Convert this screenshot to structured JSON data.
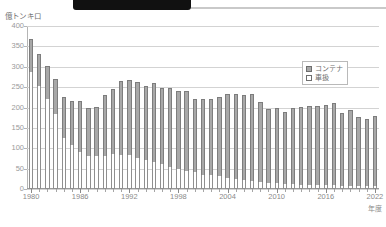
{
  "decorations": {
    "top_banner": "banner-fragment"
  },
  "axis": {
    "y_unit_label": "億トンキロ",
    "y_ticks": [
      400,
      350,
      300,
      250,
      200,
      150,
      100,
      50,
      0
    ],
    "x_title": "年度",
    "x_labels": [
      1980,
      1986,
      1992,
      1998,
      2004,
      2010,
      2016,
      2022
    ]
  },
  "legend": {
    "position": "top-right",
    "items": [
      {
        "label": "コンテナ",
        "swatch": "container",
        "color": "#a8a8a8"
      },
      {
        "label": "車扱",
        "swatch": "carload",
        "color": "#ffffff"
      }
    ]
  },
  "chart_data": {
    "type": "bar",
    "stacked": true,
    "title": "",
    "xlabel": "年度",
    "ylabel": "億トンキロ",
    "ylim": [
      0,
      400
    ],
    "ytick_step": 50,
    "grid": true,
    "legend_position": "top-right",
    "x": [
      1980,
      1981,
      1982,
      1983,
      1984,
      1985,
      1986,
      1987,
      1988,
      1989,
      1990,
      1991,
      1992,
      1993,
      1994,
      1995,
      1996,
      1997,
      1998,
      1999,
      2000,
      2001,
      2002,
      2003,
      2004,
      2005,
      2006,
      2007,
      2008,
      2009,
      2010,
      2011,
      2012,
      2013,
      2014,
      2015,
      2016,
      2017,
      2018,
      2019,
      2020,
      2021,
      2022
    ],
    "series": [
      {
        "name": "車扱",
        "color": "#ffffff",
        "values": [
          287,
          254,
          220,
          185,
          125,
          108,
          91,
          80,
          80,
          82,
          85,
          83,
          84,
          76,
          72,
          66,
          61,
          53,
          50,
          45,
          41,
          35,
          34,
          31,
          28,
          25,
          22,
          20,
          18,
          15,
          14,
          13,
          12,
          11,
          10,
          9,
          9,
          9,
          8,
          8,
          7,
          7,
          7
        ]
      },
      {
        "name": "コンテナ",
        "color": "#a8a8a8",
        "values": [
          81,
          78,
          81,
          85,
          100,
          107,
          124,
          120,
          121,
          148,
          160,
          182,
          183,
          186,
          180,
          194,
          188,
          195,
          190,
          195,
          181,
          187,
          187,
          196,
          206,
          207,
          208,
          212,
          195,
          181,
          186,
          175,
          187,
          190,
          193,
          194,
          196,
          201,
          178,
          185,
          170,
          166,
          171
        ]
      }
    ],
    "totals": [
      368,
      332,
      301,
      270,
      225,
      215,
      215,
      200,
      201,
      230,
      245,
      265,
      267,
      262,
      252,
      260,
      249,
      248,
      240,
      240,
      222,
      222,
      221,
      227,
      234,
      232,
      230,
      232,
      213,
      196,
      200,
      188,
      199,
      201,
      203,
      203,
      205,
      210,
      186,
      193,
      177,
      173,
      178
    ]
  }
}
